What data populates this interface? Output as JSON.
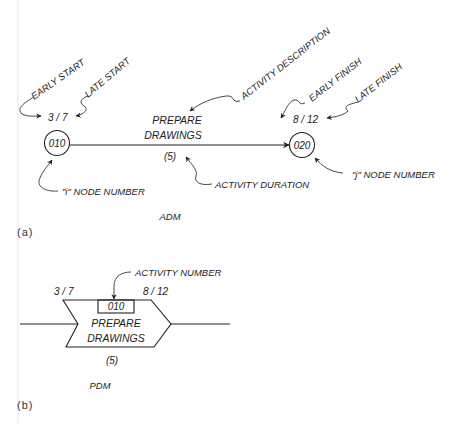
{
  "adm": {
    "panel_label": "(a)",
    "caption": "ADM",
    "i_node": {
      "number": "010",
      "label": "\"i\" NODE NUMBER",
      "early_start_late_start": "3 / 7"
    },
    "j_node": {
      "number": "020",
      "label": "\"j\" NODE NUMBER",
      "early_finish_late_finish": "8 / 12"
    },
    "activity": {
      "description_line1": "PREPARE",
      "description_line2": "DRAWINGS",
      "duration": "(5)"
    },
    "callouts": {
      "early_start": "EARLY START",
      "late_start": "LATE START",
      "activity_description": "ACTIVITY DESCRIPTION",
      "early_finish": "EARLY FINISH",
      "late_finish": "LATE FINISH",
      "activity_duration": "ACTIVITY DURATION"
    }
  },
  "pdm": {
    "panel_label": "(b)",
    "caption": "PDM",
    "start_times": "3 / 7",
    "finish_times": "8 / 12",
    "activity_number": "010",
    "activity_number_callout": "ACTIVITY NUMBER",
    "description_line1": "PREPARE",
    "description_line2": "DRAWINGS",
    "duration": "(5)"
  }
}
